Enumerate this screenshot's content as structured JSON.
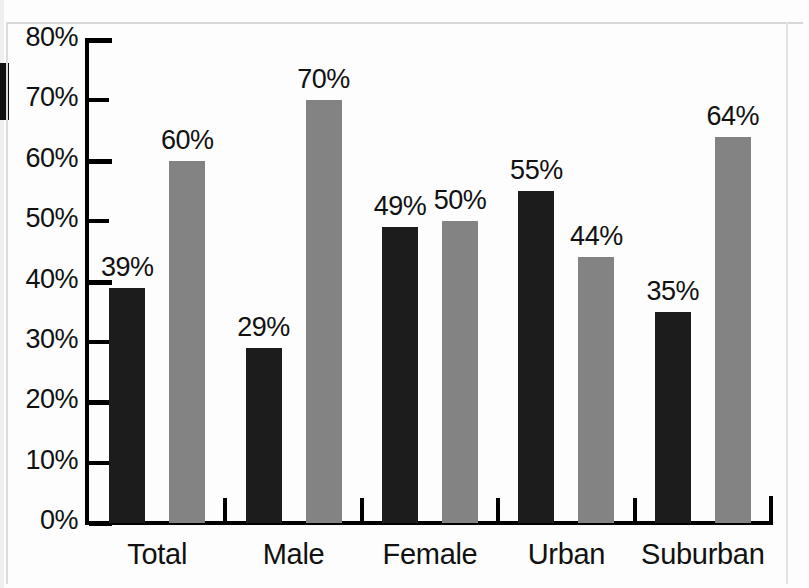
{
  "chart_data": {
    "type": "bar",
    "title": "",
    "xlabel": "",
    "ylabel": "",
    "ylim": [
      0,
      80
    ],
    "grid": false,
    "legend_position": "none",
    "categories": [
      "Total",
      "Male",
      "Female",
      "Urban",
      "Suburban"
    ],
    "y_ticks": [
      0,
      10,
      20,
      30,
      40,
      50,
      60,
      70,
      80
    ],
    "y_tick_labels": [
      "0%",
      "10%",
      "20%",
      "30%",
      "40%",
      "50%",
      "60%",
      "70%",
      "80%"
    ],
    "series": [
      {
        "name": "series-dark",
        "color": "#1c1c1c",
        "values": [
          39,
          29,
          49,
          55,
          35
        ],
        "value_labels": [
          "39%",
          "29%",
          "49%",
          "55%",
          "35%"
        ]
      },
      {
        "name": "series-gray",
        "color": "#838383",
        "values": [
          60,
          70,
          50,
          44,
          64
        ],
        "value_labels": [
          "60%",
          "70%",
          "50%",
          "44%",
          "64%"
        ]
      }
    ]
  }
}
